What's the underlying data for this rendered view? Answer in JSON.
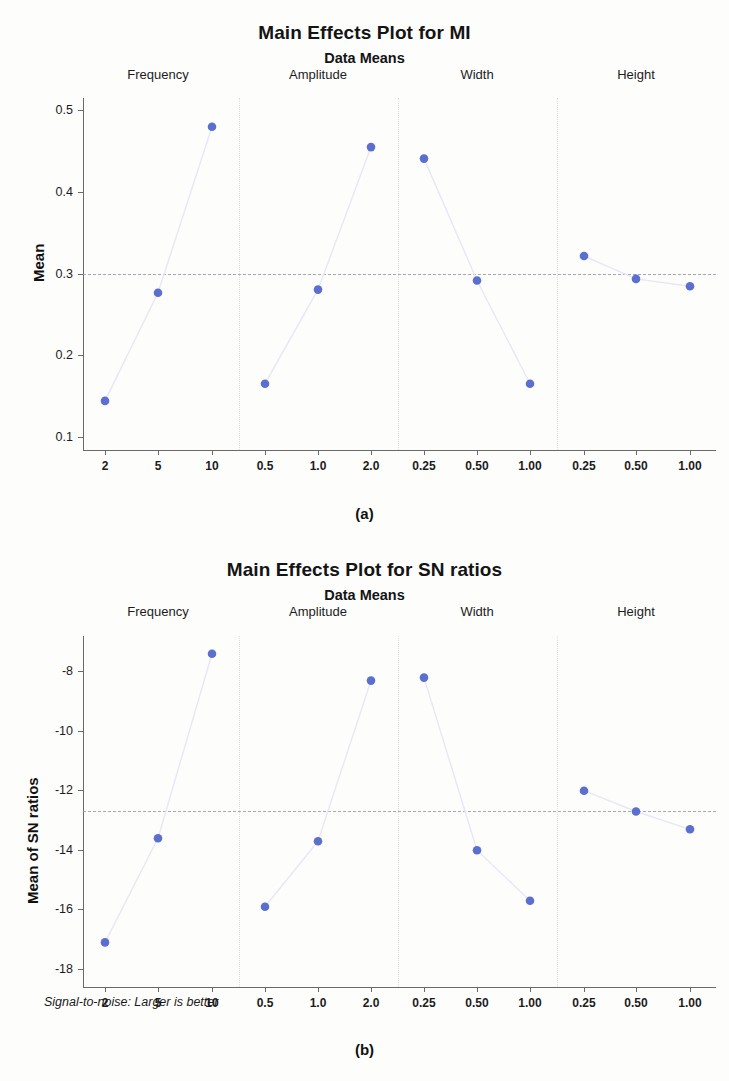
{
  "figure_a": {
    "title": "Main Effects Plot for MI",
    "subtitle": "Data Means",
    "caption": "(a)",
    "ylabel": "Mean"
  },
  "figure_b": {
    "title": "Main Effects Plot for SN ratios",
    "subtitle": "Data Means",
    "caption": "(b)",
    "ylabel": "Mean of SN ratios",
    "footnote": "Signal-to-noise: Larger is better"
  },
  "chart_data": [
    {
      "type": "line",
      "title": "Main Effects Plot for MI",
      "subtitle": "Data Means",
      "xlabel": "",
      "ylabel": "Mean",
      "ylim": [
        0.085,
        0.515
      ],
      "yticks": [
        0.5,
        0.4,
        0.3,
        0.2,
        0.1
      ],
      "ytick_labels": [
        "0.5",
        "0.4",
        "0.3",
        "0.2",
        "0.1"
      ],
      "grid": false,
      "legend": "none",
      "reference_line": 0.3,
      "panels": [
        {
          "name": "Frequency",
          "categories": [
            "2",
            "5",
            "10"
          ],
          "values": [
            0.145,
            0.277,
            0.48
          ]
        },
        {
          "name": "Amplitude",
          "categories": [
            "0.5",
            "1.0",
            "2.0"
          ],
          "values": [
            0.166,
            0.281,
            0.455
          ]
        },
        {
          "name": "Width",
          "categories": [
            "0.25",
            "0.50",
            "1.00"
          ],
          "values": [
            0.441,
            0.292,
            0.166
          ]
        },
        {
          "name": "Height",
          "categories": [
            "0.25",
            "0.50",
            "1.00"
          ],
          "values": [
            0.322,
            0.294,
            0.285
          ]
        }
      ]
    },
    {
      "type": "line",
      "title": "Main Effects Plot for SN ratios",
      "subtitle": "Data Means",
      "xlabel": "",
      "ylabel": "Mean of SN ratios",
      "ylim": [
        -18.6,
        -6.8
      ],
      "yticks": [
        -8,
        -10,
        -12,
        -14,
        -16,
        -18
      ],
      "ytick_labels": [
        "-8",
        "-10",
        "-12",
        "-14",
        "-16",
        "-18"
      ],
      "grid": false,
      "legend": "none",
      "reference_line": -12.7,
      "annotation": "Signal-to-noise: Larger is better",
      "panels": [
        {
          "name": "Frequency",
          "categories": [
            "2",
            "5",
            "10"
          ],
          "values": [
            -17.1,
            -13.6,
            -7.4
          ]
        },
        {
          "name": "Amplitude",
          "categories": [
            "0.5",
            "1.0",
            "2.0"
          ],
          "values": [
            -15.9,
            -13.7,
            -8.3
          ]
        },
        {
          "name": "Width",
          "categories": [
            "0.25",
            "0.50",
            "1.00"
          ],
          "values": [
            -8.2,
            -14.0,
            -15.7
          ]
        },
        {
          "name": "Height",
          "categories": [
            "0.25",
            "0.50",
            "1.00"
          ],
          "values": [
            -12.0,
            -12.7,
            -13.3
          ]
        }
      ]
    }
  ]
}
